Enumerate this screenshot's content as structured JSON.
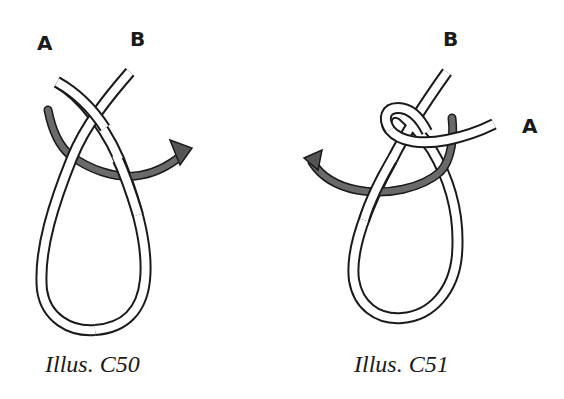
{
  "figures": [
    {
      "caption": "Illus. C50",
      "labels": {
        "a": "A",
        "b": "B"
      },
      "arrow_direction": "right"
    },
    {
      "caption": "Illus. C51",
      "labels": {
        "a": "A",
        "b": "B"
      },
      "arrow_direction": "left"
    }
  ],
  "colors": {
    "rope_outline": "#1a1a1a",
    "rope_fill": "#ffffff",
    "arrow": "#555555"
  }
}
